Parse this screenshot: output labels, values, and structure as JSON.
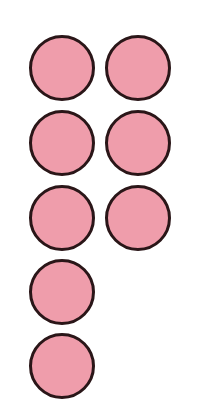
{
  "figure": {
    "fill_color": "#ef9dab",
    "outline_color": "#2a1618",
    "background_color": "#ffffff",
    "count_visible": 9,
    "rows": [
      {
        "count": 2
      },
      {
        "count": 2
      },
      {
        "count": 2
      },
      {
        "count": 1
      },
      {
        "count": 1,
        "partially_visible": true
      }
    ],
    "circles": [
      {
        "row": 1,
        "col": 1,
        "x": 29,
        "y": 35
      },
      {
        "row": 1,
        "col": 2,
        "x": 105,
        "y": 35
      },
      {
        "row": 2,
        "col": 1,
        "x": 29,
        "y": 110
      },
      {
        "row": 2,
        "col": 2,
        "x": 105,
        "y": 110
      },
      {
        "row": 3,
        "col": 1,
        "x": 29,
        "y": 185
      },
      {
        "row": 3,
        "col": 2,
        "x": 105,
        "y": 185
      },
      {
        "row": 4,
        "col": 1,
        "x": 29,
        "y": 259
      },
      {
        "row": 5,
        "col": 1,
        "x": 29,
        "y": 333
      }
    ]
  }
}
